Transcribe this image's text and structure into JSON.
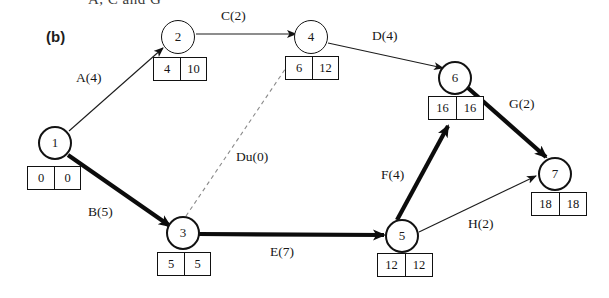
{
  "figure": {
    "cut_title": "A, C and G",
    "panel_label": "(b)",
    "type": "activity-on-arrow network diagram"
  },
  "nodes": [
    {
      "id": "1",
      "label": "1",
      "x": 55,
      "y": 143,
      "box_x": 27,
      "box_y": 166,
      "early": "0",
      "late": "0"
    },
    {
      "id": "2",
      "label": "2",
      "x": 178,
      "y": 37,
      "box_x": 153,
      "box_y": 57,
      "early": "4",
      "late": "10"
    },
    {
      "id": "3",
      "label": "3",
      "x": 183,
      "y": 233,
      "box_x": 157,
      "box_y": 252,
      "early": "5",
      "late": "5"
    },
    {
      "id": "4",
      "label": "4",
      "x": 311,
      "y": 37,
      "box_x": 285,
      "box_y": 56,
      "early": "6",
      "late": "12"
    },
    {
      "id": "5",
      "label": "5",
      "x": 402,
      "y": 236,
      "box_x": 377,
      "box_y": 253,
      "early": "12",
      "late": "12"
    },
    {
      "id": "6",
      "label": "6",
      "x": 455,
      "y": 78,
      "box_x": 428,
      "box_y": 96,
      "early": "16",
      "late": "16"
    },
    {
      "id": "7",
      "label": "7",
      "x": 555,
      "y": 174,
      "box_x": 531,
      "box_y": 192,
      "early": "18",
      "late": "18"
    }
  ],
  "edges": [
    {
      "name": "A",
      "label": "A(4)",
      "from": "1",
      "to": "2",
      "duration": 4,
      "style": "thin",
      "critical": false,
      "label_x": 76,
      "label_y": 70
    },
    {
      "name": "B",
      "label": "B(5)",
      "from": "1",
      "to": "3",
      "duration": 5,
      "style": "thick",
      "critical": true,
      "label_x": 88,
      "label_y": 204
    },
    {
      "name": "C",
      "label": "C(2)",
      "from": "2",
      "to": "4",
      "duration": 2,
      "style": "thin",
      "critical": false,
      "label_x": 221,
      "label_y": 8
    },
    {
      "name": "D",
      "label": "D(4)",
      "from": "4",
      "to": "6",
      "duration": 4,
      "style": "thin",
      "critical": false,
      "label_x": 372,
      "label_y": 28
    },
    {
      "name": "Du",
      "label": "Du(0)",
      "from": "3",
      "to": "4",
      "duration": 0,
      "style": "dashed",
      "critical": false,
      "label_x": 236,
      "label_y": 149
    },
    {
      "name": "E",
      "label": "E(7)",
      "from": "3",
      "to": "5",
      "duration": 7,
      "style": "thick",
      "critical": true,
      "label_x": 270,
      "label_y": 244
    },
    {
      "name": "F",
      "label": "F(4)",
      "from": "5",
      "to": "6",
      "duration": 4,
      "style": "thick",
      "critical": true,
      "label_x": 381,
      "label_y": 167
    },
    {
      "name": "G",
      "label": "G(2)",
      "from": "6",
      "to": "7",
      "duration": 2,
      "style": "thick",
      "critical": true,
      "label_x": 509,
      "label_y": 96
    },
    {
      "name": "H",
      "label": "H(2)",
      "from": "5",
      "to": "7",
      "duration": 2,
      "style": "thin",
      "critical": false,
      "label_x": 468,
      "label_y": 216
    }
  ],
  "colors": {
    "ink": "#121212",
    "paper": "#ffffff",
    "faded_text": "#3b3b3b"
  }
}
